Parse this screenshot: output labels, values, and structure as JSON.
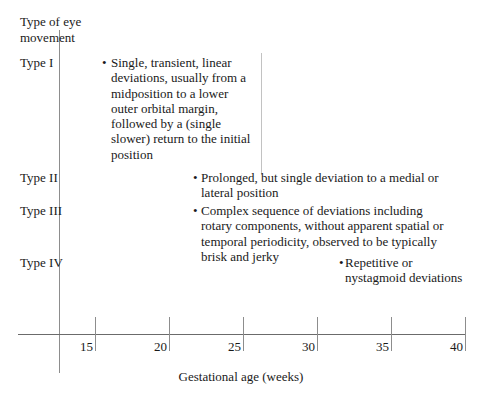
{
  "figure": {
    "y_axis_title": "Type of eye\nmovement",
    "x_axis_title": "Gestational age (weeks)"
  },
  "chart_data": {
    "type": "table",
    "title": "",
    "xlabel": "Gestational age (weeks)",
    "ylabel": "Type of eye movement",
    "xlim": [
      12,
      41
    ],
    "xticks": [
      15,
      20,
      25,
      30,
      35,
      40
    ],
    "xtick_labels": [
      "15",
      "20",
      "25",
      "30",
      "35",
      "40"
    ],
    "grid": false,
    "legend": "none",
    "categories": [
      "Type I",
      "Type II",
      "Type III",
      "Type IV"
    ],
    "annotations": [
      {
        "category": "Type I",
        "bullet": "•",
        "text": "Single, transient, linear deviations, usually from a midposition to a lower outer orbital margin, followed by a (single slower) return to the initial position",
        "x_start_weeks": 15,
        "x_end_weeks": 25
      },
      {
        "category": "Type II",
        "bullet": "•",
        "text": "Prolonged, but single deviation to a medial or lateral position",
        "x_start_weeks": 21,
        "x_end_weeks": 39
      },
      {
        "category": "Type III",
        "bullet": "•",
        "text": "Complex sequence of deviations including rotary components, without apparent spatial or temporal periodicity, observed to be typically brisk and jerky",
        "x_start_weeks": 21,
        "x_end_weeks": 39
      },
      {
        "category": "Type IV",
        "bullet": "•",
        "text": "Repetitive or nystagmoid deviations",
        "x_start_weeks": 31,
        "x_end_weeks": 39
      }
    ]
  },
  "labels": {
    "type_1": "Type I",
    "type_2": "Type II",
    "type_3": "Type III",
    "type_4": "Type IV"
  },
  "colors": {
    "background": "#ffffff",
    "text": "#1a1a1a",
    "axis": "#6b6b6b",
    "tick": "#8d8d8d",
    "divider": "#c2c2c2"
  }
}
